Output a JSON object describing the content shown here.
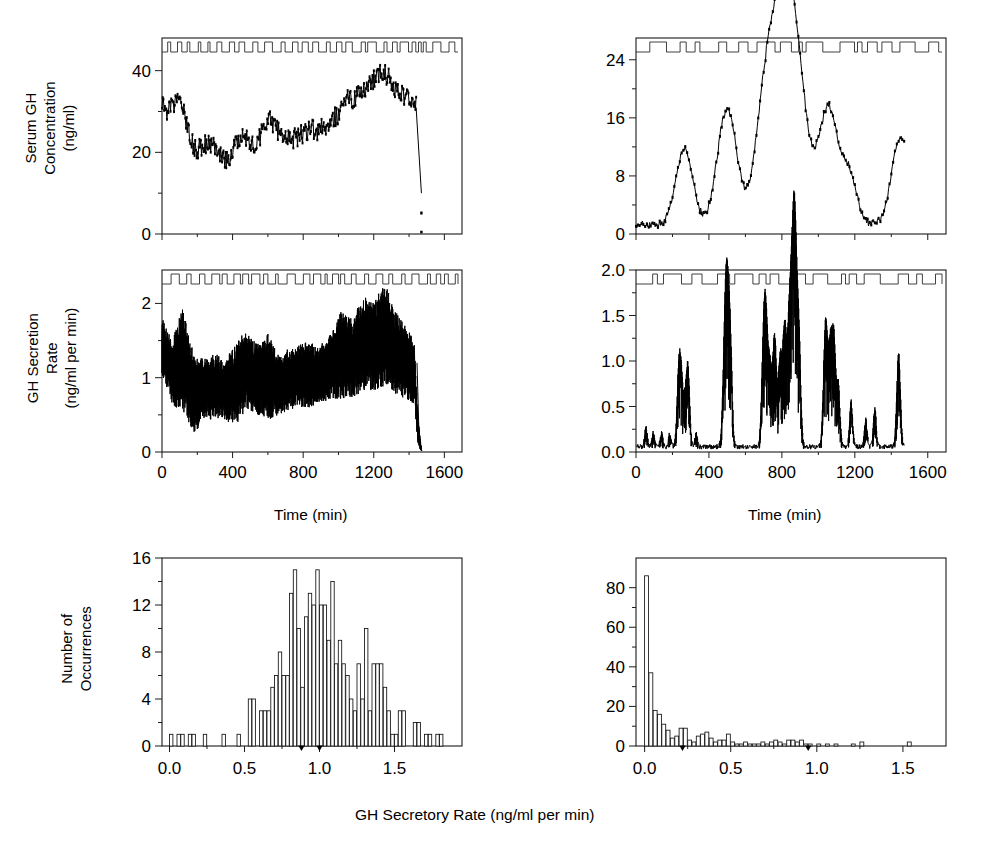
{
  "figure": {
    "caption_bottom": "GH Secretory Rate (ng/ml per min)",
    "columns": [
      "continuous",
      "pulsatile"
    ]
  },
  "labels": {
    "serum_gh_line1": "Serum GH",
    "serum_gh_line2": "Concentration",
    "serum_gh_line3": "(ng/ml)",
    "secretion_line1": "GH Secretion",
    "secretion_line2": "Rate",
    "secretion_line3": "(ng/ml per min)",
    "occurrences_line1": "Number of",
    "occurrences_line2": "Occurrences",
    "time_axis": "Time (min)"
  },
  "chart_data": [
    {
      "id": "serum-gh-left",
      "type": "line",
      "title": "",
      "xlabel": "",
      "ylabel": "Serum GH Concentration (ng/ml)",
      "xlim": [
        0,
        1700
      ],
      "ylim": [
        0,
        48
      ],
      "yticks": [
        0,
        20,
        40
      ],
      "ytick_labels": [
        "0",
        "20",
        "40"
      ],
      "xticks": [
        0,
        400,
        800,
        1200,
        1600
      ],
      "xtick_labels": [
        "",
        "",
        "",
        "",
        ""
      ],
      "grid": false,
      "description": "Continuous high tonic serum GH with small irregular fluctuations; sharp terminal drop near 1450 min",
      "baseline": 25,
      "noise_amplitude": 2.6,
      "terminal_drop_x": 1440,
      "terminal_drop_y": 10,
      "anchors_x": [
        0,
        30,
        60,
        90,
        120,
        150,
        180,
        210,
        250,
        290,
        330,
        370,
        410,
        450,
        490,
        530,
        570,
        610,
        650,
        690,
        730,
        770,
        810,
        850,
        890,
        930,
        970,
        1010,
        1050,
        1090,
        1130,
        1170,
        1210,
        1250,
        1290,
        1330,
        1370,
        1410,
        1440
      ],
      "anchors_y": [
        32,
        30,
        31,
        34,
        31,
        26,
        21,
        21,
        22,
        22,
        20,
        18,
        21,
        24,
        23,
        22,
        25,
        28,
        26,
        23,
        23,
        24,
        25,
        26,
        25,
        27,
        28,
        30,
        33,
        33,
        35,
        37,
        38,
        40,
        38,
        35,
        34,
        33,
        32
      ],
      "event_marker_density": "dense",
      "event_marker_count": 46
    },
    {
      "id": "serum-gh-right",
      "type": "line",
      "title": "",
      "xlabel": "",
      "ylabel": "Serum GH Concentration (ng/ml)",
      "xlim": [
        0,
        1700
      ],
      "ylim": [
        0,
        27
      ],
      "yticks": [
        0,
        8,
        16,
        24
      ],
      "ytick_labels": [
        "0",
        "8",
        "16",
        "24"
      ],
      "xticks": [
        0,
        400,
        800,
        1200,
        1600
      ],
      "xtick_labels": [
        "",
        "",
        "",
        "",
        ""
      ],
      "grid": false,
      "description": "Pulsatile serum GH: low basal near 1 ng/ml with discrete large bursts",
      "peaks": [
        {
          "x": 265,
          "height": 10.5
        },
        {
          "x": 500,
          "height": 16.0
        },
        {
          "x": 715,
          "height": 19.0
        },
        {
          "x": 800,
          "height": 14.5
        },
        {
          "x": 865,
          "height": 24.5
        },
        {
          "x": 1055,
          "height": 16.0
        },
        {
          "x": 1170,
          "height": 6.5
        },
        {
          "x": 1450,
          "height": 12.0
        }
      ],
      "basal": 1.0,
      "event_marker_density": "sparse",
      "event_marker_count": 32
    },
    {
      "id": "secretion-rate-left",
      "type": "line",
      "title": "",
      "xlabel": "Time (min)",
      "ylabel": "GH Secretion Rate (ng/ml per min)",
      "xlim": [
        0,
        1700
      ],
      "ylim": [
        0,
        2.45
      ],
      "yticks": [
        0,
        1,
        2
      ],
      "ytick_labels": [
        "0",
        "1",
        "2"
      ],
      "xticks": [
        0,
        400,
        800,
        1200,
        1600
      ],
      "xtick_labels": [
        "0",
        "400",
        "800",
        "1200",
        "1600"
      ],
      "grid": false,
      "description": "Dense continuous high-frequency secretion oscillating about 1.0, amplitude rising toward 1200 min, abrupt fall to 0 at 1450",
      "envelope_x": [
        0,
        60,
        120,
        180,
        240,
        300,
        360,
        420,
        480,
        540,
        600,
        660,
        720,
        780,
        840,
        900,
        960,
        1020,
        1080,
        1140,
        1200,
        1260,
        1320,
        1380,
        1430,
        1450,
        1470
      ],
      "envelope_hi": [
        1.8,
        1.55,
        1.95,
        1.3,
        1.25,
        1.35,
        1.2,
        1.55,
        1.6,
        1.45,
        1.6,
        1.3,
        1.4,
        1.45,
        1.5,
        1.45,
        1.6,
        1.95,
        1.8,
        2.1,
        2.0,
        2.3,
        1.9,
        1.7,
        1.5,
        0.5,
        0.05
      ],
      "envelope_lo": [
        1.0,
        0.62,
        0.55,
        0.25,
        0.42,
        0.45,
        0.4,
        0.35,
        0.55,
        0.5,
        0.42,
        0.5,
        0.55,
        0.6,
        0.6,
        0.62,
        0.68,
        0.72,
        0.72,
        0.8,
        0.82,
        0.85,
        0.78,
        0.72,
        0.65,
        0.1,
        0.0
      ],
      "event_marker_density": "dense",
      "event_marker_count": 44
    },
    {
      "id": "secretion-rate-right",
      "type": "line",
      "title": "",
      "xlabel": "Time (min)",
      "ylabel": "GH Secretion Rate (ng/ml per min)",
      "xlim": [
        0,
        1700
      ],
      "ylim": [
        0,
        2.0
      ],
      "yticks": [
        0.0,
        0.5,
        1.0,
        1.5,
        2.0
      ],
      "ytick_labels": [
        "0.0",
        "0.5",
        "1.0",
        "1.5",
        "2.0"
      ],
      "xticks": [
        0,
        400,
        800,
        1200,
        1600
      ],
      "xtick_labels": [
        "0",
        "400",
        "800",
        "1200",
        "1600"
      ],
      "grid": false,
      "description": "Pulsatile secretion rate: near-zero basal with sharp discrete spikes",
      "spikes": [
        {
          "x": 55,
          "height": 0.22
        },
        {
          "x": 95,
          "height": 0.16
        },
        {
          "x": 140,
          "height": 0.15
        },
        {
          "x": 185,
          "height": 0.14
        },
        {
          "x": 235,
          "height": 0.86
        },
        {
          "x": 250,
          "height": 0.62
        },
        {
          "x": 268,
          "height": 0.4
        },
        {
          "x": 285,
          "height": 0.88
        },
        {
          "x": 330,
          "height": 0.14
        },
        {
          "x": 490,
          "height": 1.42
        },
        {
          "x": 505,
          "height": 1.15
        },
        {
          "x": 520,
          "height": 0.8
        },
        {
          "x": 700,
          "height": 1.12
        },
        {
          "x": 715,
          "height": 1.1
        },
        {
          "x": 735,
          "height": 0.75
        },
        {
          "x": 760,
          "height": 1.22
        },
        {
          "x": 790,
          "height": 0.92
        },
        {
          "x": 815,
          "height": 1.3
        },
        {
          "x": 840,
          "height": 1.05
        },
        {
          "x": 860,
          "height": 1.78
        },
        {
          "x": 875,
          "height": 1.55
        },
        {
          "x": 895,
          "height": 0.95
        },
        {
          "x": 1040,
          "height": 1.38
        },
        {
          "x": 1065,
          "height": 0.95
        },
        {
          "x": 1085,
          "height": 1.18
        },
        {
          "x": 1110,
          "height": 0.65
        },
        {
          "x": 1180,
          "height": 0.5
        },
        {
          "x": 1260,
          "height": 0.3
        },
        {
          "x": 1310,
          "height": 0.42
        },
        {
          "x": 1440,
          "height": 1.02
        }
      ],
      "basal": 0.03,
      "event_marker_density": "sparse",
      "event_marker_count": 30
    },
    {
      "id": "histogram-left",
      "type": "bar",
      "title": "",
      "xlabel": "GH Secretory Rate (ng/ml per min)",
      "ylabel": "Number of Occurrences",
      "xlim": [
        -0.05,
        1.95
      ],
      "ylim": [
        0,
        16
      ],
      "yticks": [
        0,
        4,
        8,
        12,
        16
      ],
      "ytick_labels": [
        "0",
        "4",
        "8",
        "12",
        "16"
      ],
      "xticks": [
        0.0,
        0.5,
        1.0,
        1.5
      ],
      "xtick_labels": [
        "0.0",
        "0.5",
        "1.0",
        "1.5"
      ],
      "grid": false,
      "bin_width": 0.025,
      "description": "Broad roughly-normal distribution centred near 0.95 with sparse low tail",
      "bin_starts": [
        0.0,
        0.025,
        0.05,
        0.075,
        0.1,
        0.125,
        0.15,
        0.175,
        0.2,
        0.225,
        0.25,
        0.275,
        0.3,
        0.325,
        0.35,
        0.375,
        0.4,
        0.425,
        0.45,
        0.475,
        0.5,
        0.525,
        0.55,
        0.575,
        0.6,
        0.625,
        0.65,
        0.675,
        0.7,
        0.725,
        0.75,
        0.775,
        0.8,
        0.825,
        0.85,
        0.875,
        0.9,
        0.925,
        0.95,
        0.975,
        1.0,
        1.025,
        1.05,
        1.075,
        1.1,
        1.125,
        1.15,
        1.175,
        1.2,
        1.225,
        1.25,
        1.275,
        1.3,
        1.325,
        1.35,
        1.375,
        1.4,
        1.425,
        1.45,
        1.475,
        1.5,
        1.525,
        1.55,
        1.575,
        1.6,
        1.625,
        1.65,
        1.675,
        1.7,
        1.725,
        1.75,
        1.775,
        1.8,
        1.825,
        1.85,
        1.875
      ],
      "values": [
        1,
        0,
        1,
        1,
        0,
        1,
        1,
        0,
        0,
        1,
        0,
        0,
        0,
        0,
        1,
        0,
        0,
        0,
        1,
        0,
        0,
        4,
        4,
        0,
        3,
        3,
        3,
        5,
        6,
        8,
        6,
        6,
        13,
        15,
        10,
        5,
        11,
        13,
        12,
        15,
        12,
        12,
        9,
        14,
        7,
        9,
        7,
        6,
        4,
        3,
        7,
        4,
        10,
        3,
        7,
        7,
        7,
        5,
        3,
        1,
        1,
        3,
        3,
        0,
        0,
        2,
        2,
        0,
        1,
        1,
        0,
        1,
        1,
        0,
        0,
        0
      ],
      "markers": [
        0.88,
        1.0
      ]
    },
    {
      "id": "histogram-right",
      "type": "bar",
      "title": "",
      "xlabel": "GH Secretory Rate (ng/ml per min)",
      "ylabel": "Number of Occurrences",
      "xlim": [
        -0.05,
        1.75
      ],
      "ylim": [
        0,
        95
      ],
      "yticks": [
        0,
        20,
        40,
        60,
        80
      ],
      "ytick_labels": [
        "0",
        "20",
        "40",
        "60",
        "80"
      ],
      "xticks": [
        0.0,
        0.5,
        1.0,
        1.5
      ],
      "xtick_labels": [
        "0.0",
        "0.5",
        "1.0",
        "1.5"
      ],
      "grid": false,
      "bin_width": 0.025,
      "description": "Strongly right-skewed exponential-like distribution with dominant zero bin of 86",
      "bin_starts": [
        0.0,
        0.025,
        0.05,
        0.075,
        0.1,
        0.125,
        0.15,
        0.175,
        0.2,
        0.225,
        0.25,
        0.275,
        0.3,
        0.325,
        0.35,
        0.375,
        0.4,
        0.425,
        0.45,
        0.475,
        0.5,
        0.525,
        0.55,
        0.575,
        0.6,
        0.625,
        0.65,
        0.675,
        0.7,
        0.725,
        0.75,
        0.775,
        0.8,
        0.825,
        0.85,
        0.875,
        0.9,
        0.925,
        0.95,
        0.975,
        1.0,
        1.025,
        1.05,
        1.075,
        1.1,
        1.125,
        1.15,
        1.175,
        1.2,
        1.225,
        1.25,
        1.275,
        1.3,
        1.325,
        1.35,
        1.375,
        1.4,
        1.425,
        1.45,
        1.475,
        1.5,
        1.525,
        1.55,
        1.575,
        1.6,
        1.625,
        1.65,
        1.675,
        1.7
      ],
      "values": [
        86,
        37,
        18,
        16,
        11,
        8,
        4,
        5,
        9,
        9,
        3,
        2,
        5,
        6,
        7,
        4,
        2,
        3,
        3,
        6,
        2,
        1,
        1,
        2,
        1,
        1,
        1,
        2,
        1,
        2,
        3,
        2,
        1,
        3,
        3,
        2,
        3,
        1,
        1,
        0,
        1,
        0,
        1,
        0,
        1,
        0,
        0,
        0,
        1,
        0,
        2,
        0,
        0,
        0,
        0,
        0,
        0,
        0,
        0,
        0,
        0,
        2,
        0,
        0,
        0,
        0,
        0,
        0,
        0
      ],
      "markers": [
        0.22,
        0.95
      ]
    }
  ]
}
